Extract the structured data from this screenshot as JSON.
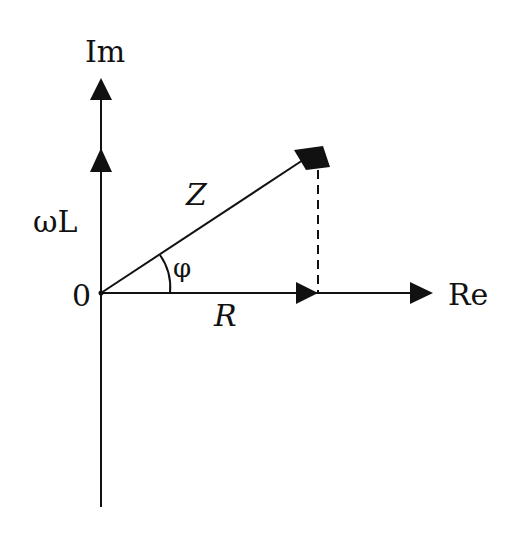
{
  "diagram": {
    "colors": {
      "line": "#111111",
      "background": "#ffffff"
    },
    "axes": {
      "imaginary_label": "Im",
      "real_label": "Re",
      "origin_label": "0"
    },
    "vectors": {
      "reactance_label": "ωL",
      "impedance_label": "Z",
      "resistance_label": "R",
      "angle_label": "φ"
    }
  }
}
